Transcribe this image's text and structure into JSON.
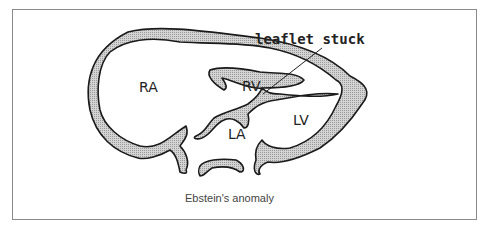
{
  "diagram": {
    "title": "Ebstein's anomaly",
    "labels": {
      "ra": "RA",
      "rv": "RV",
      "la": "LA",
      "lv": "LV"
    },
    "annotation": "leaflet stuck",
    "colors": {
      "wall_fill": "#c8c8c8",
      "outline": "#1a1a1a",
      "frame": "#8a8a8a"
    }
  }
}
